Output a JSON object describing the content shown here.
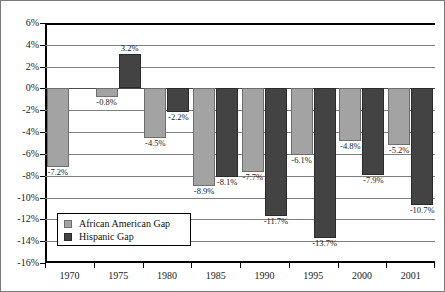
{
  "chart_data": {
    "type": "bar",
    "title": "",
    "subtitle": "",
    "xlabel": "",
    "ylabel": "",
    "categories": [
      "1970",
      "1975",
      "1980",
      "1985",
      "1990",
      "1995",
      "2000",
      "2001"
    ],
    "series": [
      {
        "name": "African American Gap",
        "color": "#a3a3a3",
        "values": [
          -7.2,
          -0.8,
          -4.5,
          -8.9,
          -7.7,
          -6.1,
          -4.8,
          -5.2
        ],
        "labels": [
          "-7.2%",
          "-0.8%",
          "-4.5%",
          "-8.9%",
          "-7.7%",
          "-6.1%",
          "-4.8%",
          "-5.2%"
        ]
      },
      {
        "name": "Hispanic Gap",
        "color": "#434343",
        "values": [
          null,
          3.2,
          -2.2,
          -8.1,
          -11.7,
          -13.7,
          -7.9,
          -10.7
        ],
        "labels": [
          null,
          "3.2%",
          "-2.2%",
          "-8.1%",
          "-11.7%",
          "-13.7%",
          "-7.9%",
          "-10.7%"
        ]
      }
    ],
    "ylim": [
      -16,
      6
    ],
    "ytick_step": 2,
    "ytick_labels": [
      "6%",
      "4%",
      "2%",
      "0%",
      "-2%",
      "-4%",
      "-6%",
      "-8%",
      "-10%",
      "-12%",
      "-14%",
      "-16%"
    ],
    "ytick_values": [
      6,
      4,
      2,
      0,
      -2,
      -4,
      -6,
      -8,
      -10,
      -12,
      -14,
      -16
    ],
    "grid": true,
    "legend_position": "lower-left"
  },
  "legend": {
    "entries": [
      {
        "label": "African American Gap",
        "swatch": "legend-swatch-african-american"
      },
      {
        "label": "Hispanic Gap",
        "swatch": "legend-swatch-hispanic"
      }
    ]
  }
}
